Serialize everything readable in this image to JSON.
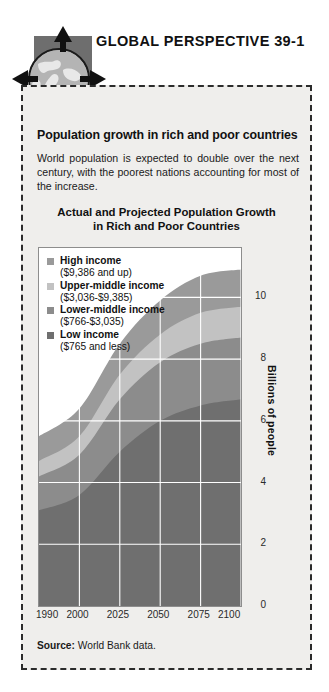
{
  "header": {
    "label": "GLOBAL PERSPECTIVE 39-1",
    "globe_icon": "globe-icon",
    "arrows": [
      "arrow-up-icon",
      "arrow-down-icon",
      "arrow-left-icon",
      "arrow-right-icon"
    ]
  },
  "panel": {
    "title": "Population growth in rich and poor countries",
    "body": "World population is expected to double over the next century, with the poorest nations accounting for most of the increase.",
    "source_label": "Source:",
    "source_text": "World Bank data."
  },
  "colors": {
    "high_income": "#9a9a9a",
    "upper_middle_income": "#c2c2c2",
    "lower_middle_income": "#8c8c8c",
    "low_income": "#6f6f6f",
    "plot_background": "#ffffff",
    "panel_background": "#efeeec",
    "border": "#2b2b2b"
  },
  "chart_data": {
    "type": "area",
    "title": "Actual and Projected Population Growth in Rich and Poor Countries",
    "title_line1": "Actual and Projected Population Growth",
    "title_line2": "in Rich and Poor Countries",
    "xlabel": "",
    "ylabel": "Billions of people",
    "stacked": true,
    "grid": true,
    "legend_position": "top-left",
    "x": [
      1990,
      2000,
      2025,
      2050,
      2075,
      2100
    ],
    "xticklabels": [
      "1990",
      "2000",
      "2025",
      "2050",
      "2075",
      "2100"
    ],
    "yticks": [
      0,
      2,
      4,
      6,
      8,
      10
    ],
    "yticklabels": [
      "0",
      "2",
      "4",
      "6",
      "8",
      "10"
    ],
    "ylim": [
      0,
      11.6
    ],
    "series": [
      {
        "name": "Low income",
        "range": "($765 and less)",
        "color": "#6f6f6f",
        "values": [
          3.1,
          3.6,
          5.0,
          6.0,
          6.5,
          6.7
        ]
      },
      {
        "name": "Lower-middle income",
        "range": "($766-$3,035)",
        "color": "#8c8c8c",
        "values": [
          1.1,
          1.3,
          1.7,
          1.9,
          2.0,
          2.0
        ]
      },
      {
        "name": "Upper-middle income",
        "range": "($3,036-$9,385)",
        "color": "#c2c2c2",
        "values": [
          0.5,
          0.6,
          0.8,
          0.9,
          1.0,
          1.0
        ]
      },
      {
        "name": "High income",
        "range": "($9,386 and up)",
        "color": "#9a9a9a",
        "values": [
          0.8,
          0.9,
          1.0,
          1.1,
          1.2,
          1.2
        ]
      }
    ],
    "totals": [
      5.5,
      6.4,
      8.5,
      9.9,
      10.7,
      10.9
    ]
  },
  "legend": [
    {
      "name": "High income",
      "range": "($9,386 and up)",
      "color": "#9a9a9a"
    },
    {
      "name": "Upper-middle income",
      "range": "($3,036-$9,385)",
      "color": "#c2c2c2"
    },
    {
      "name": "Lower-middle income",
      "range": "($766-$3,035)",
      "color": "#8c8c8c"
    },
    {
      "name": "Low income",
      "range": "($765 and less)",
      "color": "#6f6f6f"
    }
  ]
}
